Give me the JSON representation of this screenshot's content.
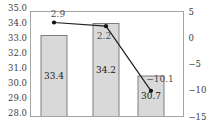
{
  "chart_data": {
    "type": "combo-bar-line",
    "categories": [
      "",
      "",
      ""
    ],
    "series": [
      {
        "name": "bar-series",
        "type": "bar",
        "axis": "left",
        "values": [
          33.4,
          34.2,
          30.7
        ],
        "labels": [
          "33.4",
          "34.2",
          "30.7"
        ]
      },
      {
        "name": "line-series",
        "type": "line",
        "axis": "right",
        "values": [
          2.9,
          2.2,
          -10.1
        ],
        "labels": [
          "2.9",
          "2.2",
          "−10.1"
        ]
      }
    ],
    "left_axis": {
      "min": 28.0,
      "max": 35.0,
      "tick_step": 1.0,
      "tick_labels": [
        "35.0",
        "34.0",
        "33.0",
        "32.0",
        "31.0",
        "30.0",
        "29.0",
        "28.0"
      ]
    },
    "right_axis": {
      "min": -15,
      "max": 5,
      "tick_step": 5,
      "tick_labels": [
        "5",
        "0",
        "−5",
        "−10",
        "−15"
      ]
    },
    "grid": false,
    "legend": null
  },
  "colors": {
    "background": "#ffffff",
    "bar_fill": "#d9d9d9",
    "bar_border": "#7f7f7f",
    "plot_border": "#a3a3a3",
    "line": "#1f1f1f",
    "marker": "#111111",
    "tick_text": "#3d3d3d",
    "bar_label_text": "#1a1a1a",
    "line_label_text": "#4f4f4f"
  }
}
